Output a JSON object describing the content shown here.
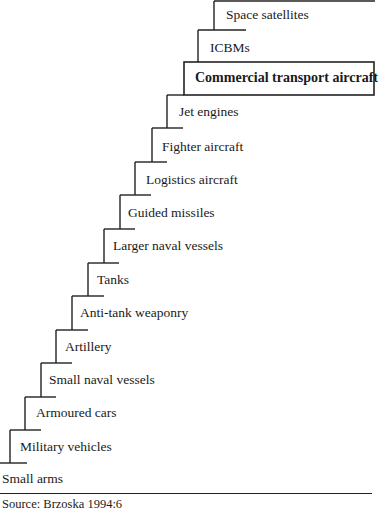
{
  "diagram": {
    "type": "staircase",
    "highlighted_step": "Commercial transport aircraft",
    "steps_top_to_bottom": [
      {
        "label": "Space satellites",
        "x": 214,
        "y": 0,
        "text_x": 226,
        "text_y": 7
      },
      {
        "label": "ICBMs",
        "x": 198,
        "y": 30,
        "text_x": 210,
        "text_y": 40
      },
      {
        "label": "Commercial transport aircraft",
        "x": 184,
        "y": 62,
        "text_x": 195,
        "text_y": 70,
        "boxed": true
      },
      {
        "label": "Jet engines",
        "x": 167,
        "y": 95,
        "text_x": 179,
        "text_y": 104
      },
      {
        "label": "Fighter aircraft",
        "x": 152,
        "y": 128,
        "text_x": 162,
        "text_y": 139
      },
      {
        "label": "Logistics aircraft",
        "x": 135,
        "y": 162,
        "text_x": 146,
        "text_y": 172
      },
      {
        "label": "Guided missiles",
        "x": 120,
        "y": 195,
        "text_x": 128,
        "text_y": 205
      },
      {
        "label": "Larger naval vessels",
        "x": 104,
        "y": 229,
        "text_x": 113,
        "text_y": 238
      },
      {
        "label": "Tanks",
        "x": 88,
        "y": 263,
        "text_x": 97,
        "text_y": 272
      },
      {
        "label": "Anti-tank weaponry",
        "x": 72,
        "y": 296,
        "text_x": 80,
        "text_y": 305
      },
      {
        "label": "Artillery",
        "x": 56,
        "y": 330,
        "text_x": 65,
        "text_y": 339
      },
      {
        "label": "Small naval vessels",
        "x": 41,
        "y": 363,
        "text_x": 49,
        "text_y": 372
      },
      {
        "label": "Armoured cars",
        "x": 25,
        "y": 397,
        "text_x": 36,
        "text_y": 405
      },
      {
        "label": "Military vehicles",
        "x": 10,
        "y": 430,
        "text_x": 20,
        "text_y": 439
      },
      {
        "label": "Small arms",
        "x": 0,
        "y": 463,
        "text_x": 2,
        "text_y": 471
      }
    ]
  },
  "source": "Source: Brzoska 1994:6"
}
